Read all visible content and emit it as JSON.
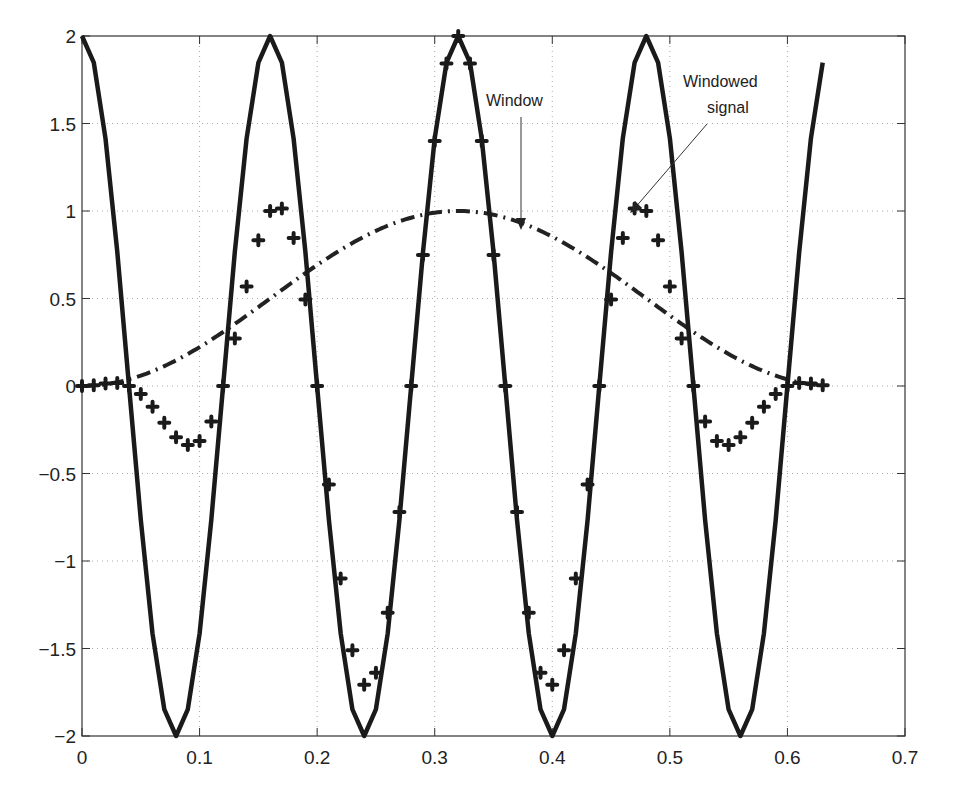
{
  "chart_data": {
    "type": "line",
    "title": "",
    "xlabel": "",
    "ylabel": "",
    "xlim": [
      0,
      0.7
    ],
    "ylim": [
      -2,
      2
    ],
    "grid": true,
    "legend": null,
    "x_ticks": [
      "0",
      "0.1",
      "0.2",
      "0.3",
      "0.4",
      "0.5",
      "0.6",
      "0.7"
    ],
    "y_ticks": [
      "2",
      "1.5",
      "1",
      "0.5",
      "0",
      "−0.5",
      "−1",
      "−1.5",
      "−2"
    ],
    "x_tick_values": [
      0,
      0.1,
      0.2,
      0.3,
      0.4,
      0.5,
      0.6,
      0.7
    ],
    "y_tick_values": [
      2,
      1.5,
      1,
      0.5,
      0,
      -0.5,
      -1,
      -1.5,
      -2
    ],
    "sampling": {
      "t_start": 0,
      "t_end": 0.63,
      "dt": 0.01
    },
    "series": [
      {
        "name": "Signal",
        "style": "solid-thick",
        "description": "2*cos(2*pi*t/0.16)",
        "amplitude": 2,
        "period": 0.16
      },
      {
        "name": "Window",
        "style": "dash-dot",
        "description": "Hann window centered at 0.32, half-width 0.32",
        "center": 0.32,
        "half_width": 0.32
      },
      {
        "name": "Windowed signal",
        "style": "plus-markers",
        "description": "Signal × Window"
      }
    ],
    "annotations": [
      {
        "text": "Window",
        "text_xy": [
          0.375,
          1.62
        ],
        "arrow_to": [
          0.375,
          0.88
        ]
      },
      {
        "text_lines": [
          "Windowed",
          "signal"
        ],
        "text_xy": [
          0.545,
          1.67
        ],
        "arrow_to": [
          0.465,
          0.99
        ]
      }
    ]
  },
  "labels": {
    "window": "Window",
    "windowed_line1": "Windowed",
    "windowed_line2": "signal"
  }
}
